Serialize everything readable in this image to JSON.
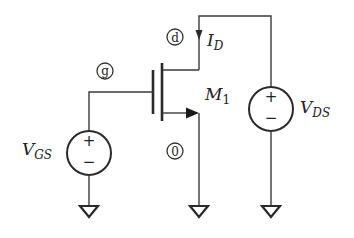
{
  "diagram": {
    "type": "circuit-schematic",
    "transistor": {
      "label": "M1",
      "label_main": "M",
      "label_sub": "1",
      "type": "NMOS"
    },
    "nodes": {
      "drain": "d",
      "gate": "g",
      "source": "0"
    },
    "current": {
      "label_main": "I",
      "label_sub": "D",
      "direction": "down-into-drain"
    },
    "sources": [
      {
        "name": "VGS",
        "label_main": "V",
        "label_sub": "GS",
        "plus": "+",
        "minus": "−"
      },
      {
        "name": "VDS",
        "label_main": "V",
        "label_sub": "DS",
        "plus": "+",
        "minus": "−"
      }
    ],
    "grounds": 3,
    "colors": {
      "line": "#2a2a2a",
      "background": "#ffffff"
    }
  }
}
